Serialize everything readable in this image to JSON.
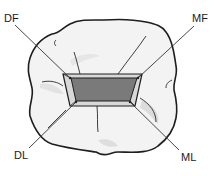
{
  "figure": {
    "labels": {
      "df": "DF",
      "mf": "MF",
      "dl": "DL",
      "ml": "ML"
    },
    "colors": {
      "outline": "#1e1e1e",
      "tooth_fill": "#f2f2f2",
      "tooth_shadow": "#dcdcdc",
      "cavity_wall": "#d6d6d6",
      "cavity_floor": "#7a7a7a",
      "leader_line": "#333333"
    }
  }
}
